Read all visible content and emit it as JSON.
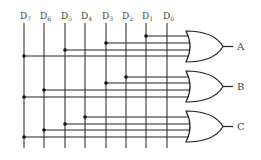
{
  "diagram": {
    "inputs": [
      {
        "label": "D",
        "sub": "7",
        "x": 24
      },
      {
        "label": "D",
        "sub": "6",
        "x": 44
      },
      {
        "label": "D",
        "sub": "5",
        "x": 65
      },
      {
        "label": "D",
        "sub": "4",
        "x": 85
      },
      {
        "label": "D",
        "sub": "3",
        "x": 106
      },
      {
        "label": "D",
        "sub": "2",
        "x": 126
      },
      {
        "label": "D",
        "sub": "1",
        "x": 146
      },
      {
        "label": "D",
        "sub": "0",
        "x": 167
      }
    ],
    "gates": [
      {
        "name": "A",
        "type": "OR",
        "top": 31,
        "inputs": [
          "D1",
          "D3",
          "D5",
          "D7"
        ],
        "input_y": [
          36,
          43,
          50,
          56
        ]
      },
      {
        "name": "B",
        "type": "OR",
        "top": 71,
        "inputs": [
          "D2",
          "D3",
          "D6",
          "D7"
        ],
        "input_y": [
          77,
          83,
          90,
          97
        ]
      },
      {
        "name": "C",
        "type": "OR",
        "top": 111,
        "inputs": [
          "D4",
          "D5",
          "D6",
          "D7"
        ],
        "input_y": [
          117,
          124,
          130,
          137
        ]
      }
    ],
    "outputs": [
      "A",
      "B",
      "C"
    ],
    "colors": {
      "line": "#222222",
      "text": "#444444",
      "background": "#ffffff"
    }
  }
}
